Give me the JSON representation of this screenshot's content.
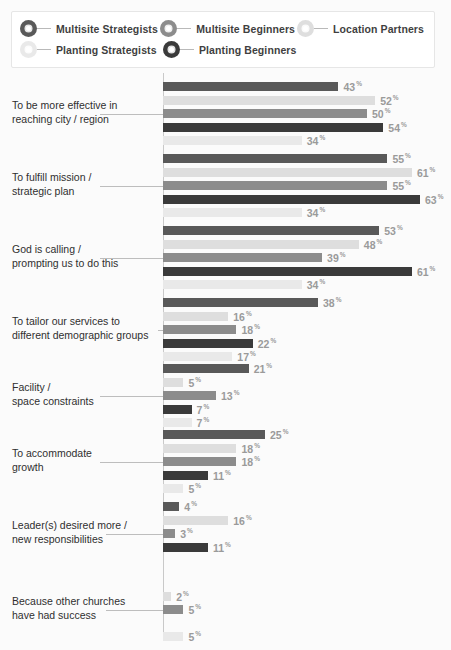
{
  "legend": {
    "rows": [
      [
        {
          "label": "Multisite Strategists",
          "color": "#595959",
          "icon": "legend-marker-circle"
        },
        {
          "label": "Multisite Beginners",
          "color": "#8c8c8c",
          "icon": "legend-marker-circle"
        },
        {
          "label": "Location Partners",
          "color": "#dedede",
          "icon": "legend-marker-circle"
        }
      ],
      [
        {
          "label": "Planting Strategists",
          "color": "#e9e9e9",
          "icon": "legend-marker-circle"
        },
        {
          "label": "Planting Beginners",
          "color": "#3a3a3a",
          "icon": "legend-marker-circle"
        }
      ]
    ]
  },
  "chart_data": {
    "type": "bar",
    "orientation": "horizontal",
    "title": "",
    "xlabel": "",
    "ylabel": "",
    "xlim": [
      0,
      70
    ],
    "grid": false,
    "value_suffix": "%",
    "legend_position": "top",
    "series_order": [
      "Multisite Strategists",
      "Location Partners",
      "Multisite Beginners",
      "Planting Beginners",
      "Planting Strategists"
    ],
    "series_colors": {
      "Multisite Strategists": "#595959",
      "Location Partners": "#dedede",
      "Multisite Beginners": "#8c8c8c",
      "Planting Beginners": "#3a3a3a",
      "Planting Strategists": "#e9e9e9"
    },
    "categories": [
      "To be more effective in reaching city / region",
      "To fulfill mission / strategic plan",
      "God is calling / prompting us to do this",
      "To tailor our services to different demographic groups",
      "Facility / space constraints",
      "To accommodate growth",
      "Leader(s) desired more / new responsibilities",
      "Because other churches have had success"
    ],
    "series": [
      {
        "name": "Multisite Strategists",
        "values": [
          43,
          55,
          53,
          38,
          21,
          25,
          4,
          null
        ]
      },
      {
        "name": "Location Partners",
        "values": [
          52,
          61,
          48,
          16,
          5,
          18,
          16,
          2
        ]
      },
      {
        "name": "Multisite Beginners",
        "values": [
          50,
          55,
          39,
          18,
          13,
          18,
          3,
          5
        ]
      },
      {
        "name": "Planting Beginners",
        "values": [
          54,
          63,
          61,
          22,
          7,
          11,
          11,
          null
        ]
      },
      {
        "name": "Planting Strategists",
        "values": [
          34,
          34,
          34,
          17,
          7,
          5,
          null,
          5
        ]
      }
    ]
  },
  "categories_display": [
    {
      "line1": "To be more effective in",
      "line2": "reaching city / region"
    },
    {
      "line1": "To fulfill mission /",
      "line2": "strategic plan"
    },
    {
      "line1": "God is calling /",
      "line2": "prompting us to do this"
    },
    {
      "line1": "To tailor our services to",
      "line2": "different demographic groups"
    },
    {
      "line1": "Facility /",
      "line2": "space constraints"
    },
    {
      "line1": "To accommodate",
      "line2": "growth"
    },
    {
      "line1": "Leader(s) desired more /",
      "line2": "new responsibilities"
    },
    {
      "line1": "Because other churches",
      "line2": "have had success"
    }
  ]
}
